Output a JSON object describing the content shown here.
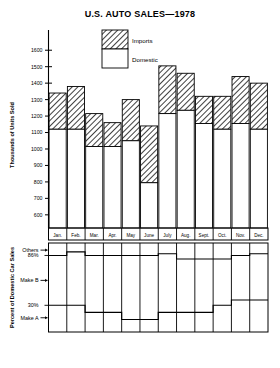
{
  "title": "U.S. AUTO SALES—1978",
  "legend": {
    "position": "inside-top",
    "entries": [
      {
        "label": "Imports",
        "fill": "hatch"
      },
      {
        "label": "Domestic",
        "fill": "white"
      }
    ]
  },
  "upper": {
    "ylabel": "Thousands of Units Sold",
    "yticks": [
      1600,
      1500,
      1400,
      1300,
      1200,
      1100,
      1000,
      900,
      800,
      700,
      600
    ],
    "ylim": [
      520,
      1650
    ]
  },
  "lower": {
    "ylabel": "Percent of Domestic Car Sales",
    "xlabel": "Domestic Car Sales",
    "tick_labels": [
      "Others",
      "86%",
      "Make B",
      "30%",
      "Make A"
    ],
    "marked_pcts": [
      "86%",
      "30%"
    ]
  },
  "chart_data": {
    "type": "bar",
    "title": "U.S. AUTO SALES—1978",
    "xlabel": "",
    "ylabel": "Thousands of Units Sold",
    "ylim": [
      520,
      1650
    ],
    "yticks": [
      600,
      700,
      800,
      900,
      1000,
      1100,
      1200,
      1300,
      1400,
      1500,
      1600
    ],
    "grid": false,
    "legend": [
      "Imports",
      "Domestic"
    ],
    "stacked": true,
    "categories": [
      "Jan.",
      "Feb.",
      "Mar.",
      "Apr.",
      "May",
      "June",
      "July",
      "Aug.",
      "Sept.",
      "Oct.",
      "Nov.",
      "Dec."
    ],
    "series": [
      {
        "name": "Domestic",
        "values": [
          1120,
          1120,
          1015,
          1015,
          1050,
          795,
          1215,
          1235,
          1155,
          1120,
          1155,
          1120
        ]
      },
      {
        "name": "Imports",
        "values": [
          220,
          260,
          200,
          145,
          250,
          345,
          290,
          225,
          165,
          200,
          285,
          280
        ]
      }
    ],
    "totals": [
      1340,
      1380,
      1215,
      1160,
      1300,
      1140,
      1505,
      1460,
      1320,
      1320,
      1440,
      1400
    ],
    "secondary_panel": {
      "type": "stacked-percent",
      "title": "Domestic Car Sales",
      "ylabel": "Percent of Domestic Car Sales",
      "ylim": [
        0,
        100
      ],
      "reference_lines": [
        86,
        30
      ],
      "band_labels": [
        "Others",
        "Make B",
        "Make A"
      ],
      "categories": [
        "Jan.",
        "Feb.",
        "Mar.",
        "Apr.",
        "May",
        "June",
        "July",
        "Aug.",
        "Sept.",
        "Oct.",
        "Nov.",
        "Dec."
      ],
      "series": [
        {
          "name": "Make A",
          "values": [
            30,
            30,
            22,
            22,
            14,
            14,
            22,
            22,
            22,
            30,
            36,
            36
          ]
        },
        {
          "name": "Make B",
          "values": [
            56,
            60,
            64,
            64,
            72,
            72,
            66,
            60,
            60,
            52,
            50,
            52
          ]
        },
        {
          "name": "Others",
          "values": [
            14,
            10,
            14,
            14,
            14,
            14,
            12,
            18,
            18,
            18,
            14,
            12
          ]
        }
      ],
      "upper_boundary": [
        86,
        90,
        86,
        86,
        86,
        86,
        88,
        82,
        82,
        82,
        86,
        88
      ],
      "lower_boundary": [
        30,
        30,
        22,
        22,
        14,
        14,
        22,
        22,
        22,
        30,
        36,
        36
      ]
    }
  }
}
